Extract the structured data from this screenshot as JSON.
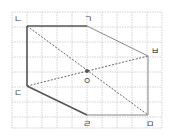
{
  "diagram": {
    "type": "geometry-hexagon-on-grid",
    "grid": {
      "x_lines": [
        12,
        27,
        42,
        57,
        72,
        87,
        102,
        117,
        132,
        147,
        162
      ],
      "y_lines": [
        12,
        27,
        42,
        57,
        72,
        87,
        102,
        117,
        128
      ],
      "color": "#c8c8c8"
    },
    "points": {
      "giyeok": {
        "label": "ㄱ",
        "x": 87,
        "y": 26
      },
      "nieun": {
        "label": "ㄴ",
        "x": 27,
        "y": 26
      },
      "digeut": {
        "label": "ㄷ",
        "x": 27,
        "y": 86
      },
      "rieul": {
        "label": "ㄹ",
        "x": 87,
        "y": 115
      },
      "mieum": {
        "label": "ㅁ",
        "x": 148,
        "y": 115
      },
      "bieup": {
        "label": "ㅂ",
        "x": 148,
        "y": 56
      },
      "ieung": {
        "label": "ㅇ",
        "x": 87,
        "y": 71
      }
    },
    "edges_solid_dark": [
      [
        "nieun",
        "giyeok"
      ],
      [
        "nieun",
        "digeut"
      ],
      [
        "digeut",
        "rieul"
      ]
    ],
    "edges_solid_light": [
      [
        "giyeok",
        "bieup"
      ],
      [
        "bieup",
        "mieum"
      ],
      [
        "mieum",
        "rieul"
      ]
    ],
    "edges_dashed": [
      [
        "nieun",
        "mieum"
      ],
      [
        "digeut",
        "bieup"
      ]
    ],
    "colors": {
      "dark_line": "#555555",
      "light_line": "#888888",
      "dashed_line": "#666666",
      "label": "#444444"
    }
  }
}
